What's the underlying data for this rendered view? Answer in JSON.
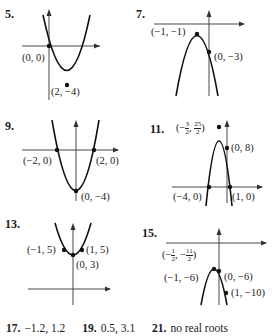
{
  "page": {
    "problems": [
      {
        "number": "5.",
        "opens": "up",
        "points": [
          {
            "label": "(0, 0)",
            "x": 0,
            "y": 0
          },
          {
            "label": "(2, −4)",
            "x": 2,
            "y": -4
          }
        ]
      },
      {
        "number": "7.",
        "opens": "down",
        "points": [
          {
            "label": "(−1, −1)",
            "x": -1,
            "y": -1
          },
          {
            "label": "(0, −3)",
            "x": 0,
            "y": -3
          }
        ]
      },
      {
        "number": "9.",
        "opens": "up",
        "points": [
          {
            "label": "(−2, 0)",
            "x": -2,
            "y": 0
          },
          {
            "label": "(2, 0)",
            "x": 2,
            "y": 0
          },
          {
            "label": "(0, −4)",
            "x": 0,
            "y": -4
          }
        ]
      },
      {
        "number": "11.",
        "opens": "down",
        "vertex_label": {
          "open": "(−",
          "frac1_num": "3",
          "frac1_den": "2",
          "sep": ", ",
          "frac2_num": "25",
          "frac2_den": "2",
          "close": ")"
        },
        "points": [
          {
            "label": "(0, 8)",
            "x": 0,
            "y": 8
          },
          {
            "label": "(−4, 0)",
            "x": -4,
            "y": 0
          },
          {
            "label": "(1, 0)",
            "x": 1,
            "y": 0
          }
        ]
      },
      {
        "number": "13.",
        "opens": "up",
        "points": [
          {
            "label": "(−1, 5)",
            "x": -1,
            "y": 5
          },
          {
            "label": "(1, 5)",
            "x": 1,
            "y": 5
          },
          {
            "label": "(0, 3)",
            "x": 0,
            "y": 3
          }
        ]
      },
      {
        "number": "15.",
        "opens": "down",
        "vertex_label": {
          "open": "(−",
          "frac1_num": "1",
          "frac1_den": "2",
          "sep": ", −",
          "frac2_num": "11",
          "frac2_den": "2",
          "close": ")"
        },
        "points": [
          {
            "label": "(−1, −6)",
            "x": -1,
            "y": -6
          },
          {
            "label": "(0, −6)",
            "x": 0,
            "y": -6
          },
          {
            "label": "(1, −10)",
            "x": 1,
            "y": -10
          }
        ]
      }
    ],
    "answers": [
      {
        "number": "17.",
        "text": "−1.2, 1.2"
      },
      {
        "number": "19.",
        "text": "0.5, 3.1"
      },
      {
        "number": "21.",
        "text": "no real roots"
      }
    ]
  }
}
